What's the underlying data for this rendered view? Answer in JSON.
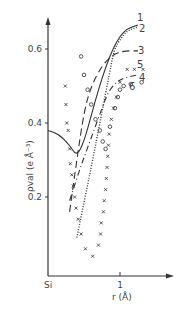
{
  "chart_data": {
    "type": "line",
    "title": "",
    "xlabel": "r (Å)",
    "ylabel": "ρval (e Å⁻³)",
    "x_ticks": [
      {
        "value": 0,
        "label": "Si"
      },
      {
        "value": 1,
        "label": "1"
      }
    ],
    "y_ticks": [
      {
        "value": 0.2,
        "label": "0.2"
      },
      {
        "value": 0.4,
        "label": "0.4"
      },
      {
        "value": 0.6,
        "label": "0.6"
      }
    ],
    "xlim": [
      0,
      1.7
    ],
    "ylim": [
      0,
      0.66
    ],
    "grid": false,
    "legend_position": "inline labels at right end of curves",
    "series": [
      {
        "name": "1",
        "style": "solid",
        "points": [
          [
            0,
            0.38
          ],
          [
            0.15,
            0.37
          ],
          [
            0.3,
            0.34
          ],
          [
            0.4,
            0.31
          ],
          [
            0.5,
            0.35
          ],
          [
            0.6,
            0.42
          ],
          [
            0.7,
            0.49
          ],
          [
            0.8,
            0.55
          ],
          [
            0.9,
            0.6
          ],
          [
            1.0,
            0.635
          ],
          [
            1.1,
            0.655
          ],
          [
            1.25,
            0.665
          ]
        ]
      },
      {
        "name": "2",
        "style": "dotted",
        "points": [
          [
            0.4,
            0.09
          ],
          [
            0.6,
            0.28
          ],
          [
            0.75,
            0.43
          ],
          [
            0.85,
            0.53
          ],
          [
            0.92,
            0.6
          ],
          [
            1.0,
            0.625
          ],
          [
            1.1,
            0.65
          ],
          [
            1.25,
            0.66
          ]
        ]
      },
      {
        "name": "3",
        "style": "long-dash",
        "points": [
          [
            0.3,
            0.16
          ],
          [
            0.4,
            0.3
          ],
          [
            0.5,
            0.43
          ],
          [
            0.6,
            0.5
          ],
          [
            0.75,
            0.555
          ],
          [
            0.9,
            0.585
          ],
          [
            1.05,
            0.595
          ],
          [
            1.25,
            0.595
          ]
        ]
      },
      {
        "name": "4",
        "style": "dash-dot",
        "points": [
          [
            0.3,
            0.19
          ],
          [
            0.45,
            0.28
          ],
          [
            0.6,
            0.36
          ],
          [
            0.75,
            0.44
          ],
          [
            0.85,
            0.49
          ],
          [
            1.0,
            0.52
          ],
          [
            1.25,
            0.53
          ]
        ]
      },
      {
        "name": "5",
        "style": "crosses",
        "points": [
          [
            0.24,
            0.5
          ],
          [
            0.25,
            0.45
          ],
          [
            0.26,
            0.4
          ],
          [
            0.28,
            0.38
          ],
          [
            0.3,
            0.33
          ],
          [
            0.31,
            0.29
          ],
          [
            0.33,
            0.26
          ],
          [
            0.35,
            0.23
          ],
          [
            0.37,
            0.2
          ],
          [
            0.39,
            0.17
          ],
          [
            0.42,
            0.14
          ],
          [
            0.46,
            0.1
          ],
          [
            0.52,
            0.06
          ],
          [
            0.62,
            0.04
          ],
          [
            0.7,
            0.07
          ],
          [
            0.73,
            0.1
          ],
          [
            0.74,
            0.13
          ],
          [
            0.77,
            0.16
          ],
          [
            0.78,
            0.19
          ],
          [
            0.8,
            0.22
          ],
          [
            0.81,
            0.25
          ],
          [
            0.82,
            0.28
          ],
          [
            0.83,
            0.31
          ],
          [
            0.84,
            0.34
          ],
          [
            0.85,
            0.37
          ],
          [
            0.88,
            0.41
          ],
          [
            0.91,
            0.44
          ],
          [
            0.95,
            0.47
          ],
          [
            1.0,
            0.51
          ],
          [
            1.1,
            0.545
          ],
          [
            1.2,
            0.545
          ],
          [
            1.32,
            0.545
          ]
        ]
      },
      {
        "name": "6",
        "style": "circles",
        "points": [
          [
            0.46,
            0.58
          ],
          [
            0.5,
            0.53
          ],
          [
            0.55,
            0.49
          ],
          [
            0.6,
            0.45
          ],
          [
            0.66,
            0.41
          ],
          [
            0.72,
            0.38
          ],
          [
            0.76,
            0.35
          ],
          [
            0.8,
            0.33
          ],
          [
            0.86,
            0.39
          ],
          [
            0.93,
            0.44
          ],
          [
            0.97,
            0.47
          ],
          [
            1.0,
            0.49
          ],
          [
            1.05,
            0.5
          ],
          [
            1.15,
            0.505
          ],
          [
            1.3,
            0.51
          ]
        ]
      }
    ],
    "curve_labels": [
      {
        "text": "1",
        "x": 137,
        "y": 21
      },
      {
        "text": "2",
        "x": 139,
        "y": 32
      },
      {
        "text": "3",
        "x": 138,
        "y": 54
      },
      {
        "text": "5",
        "x": 137,
        "y": 68
      },
      {
        "text": "4",
        "x": 139,
        "y": 81
      },
      {
        "text": "6",
        "x": 129,
        "y": 90
      }
    ]
  }
}
